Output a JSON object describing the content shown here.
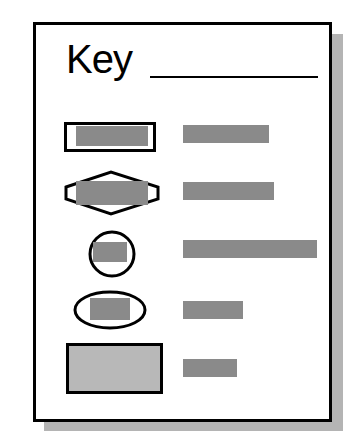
{
  "title": "Key",
  "colors": {
    "frame": "#000000",
    "shadow": "#b4b4b4",
    "symbol_fill": "#8a8a8a",
    "large_box_fill": "#b8b8b8",
    "label_placeholder": "#8a8a8a"
  },
  "legend_items": [
    {
      "symbol": "rectangle",
      "label_placeholder_width": 86
    },
    {
      "symbol": "hexagon",
      "label_placeholder_width": 91
    },
    {
      "symbol": "circle",
      "label_placeholder_width": 134
    },
    {
      "symbol": "ellipse",
      "label_placeholder_width": 60
    },
    {
      "symbol": "filled-rectangle",
      "label_placeholder_width": 54
    }
  ]
}
